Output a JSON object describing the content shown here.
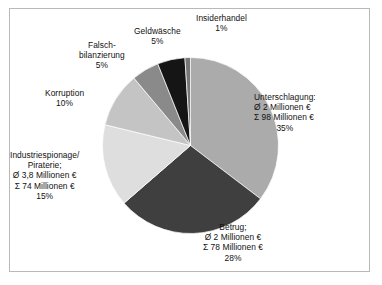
{
  "figure": {
    "border_color": "#b9b9b9",
    "background": "#ffffff"
  },
  "chart_data": {
    "type": "pie",
    "title": "",
    "subtitle": "",
    "xlabel": "",
    "ylabel": "",
    "legend_position": "none",
    "grid": false,
    "start_angle_deg": 0,
    "direction": "clockwise",
    "currency": "€",
    "unit_label": "Millionen €",
    "mean_symbol": "Ø",
    "sum_symbol": "Σ",
    "categories": [
      "Unterschlagung",
      "Betrug",
      "Industriespionage/Piraterie",
      "Korruption",
      "Falschbilanzierung",
      "Geldwäsche",
      "Insiderhandel"
    ],
    "values": [
      35,
      28,
      15,
      10,
      5,
      5,
      1
    ],
    "colors": [
      "#ababab",
      "#3f3f3f",
      "#dedede",
      "#c4c4c4",
      "#8a8a8a",
      "#151515",
      "#777777"
    ],
    "slices": [
      {
        "name": "Unterschlagung",
        "percent": 35,
        "percent_label": "35%",
        "mean": "Ø 2 Millionen €",
        "sum": "Σ 98 Millionen €",
        "color": "#ababab"
      },
      {
        "name": "Betrug",
        "percent": 28,
        "percent_label": "28%",
        "mean": "Ø 2 Millionen €",
        "sum": "Σ 78 Millionen €",
        "color": "#3f3f3f"
      },
      {
        "name": "Industriespionage/Piraterie",
        "percent": 15,
        "percent_label": "15%",
        "mean": "Ø 3,8 Millionen €",
        "sum": "Σ 74 Millionen €",
        "color": "#dedede"
      },
      {
        "name": "Korruption",
        "percent": 10,
        "percent_label": "10%",
        "mean": "",
        "sum": "",
        "color": "#c4c4c4"
      },
      {
        "name": "Falschbilanzierung",
        "percent": 5,
        "percent_label": "5%",
        "mean": "",
        "sum": "",
        "color": "#8a8a8a"
      },
      {
        "name": "Geldwäsche",
        "percent": 5,
        "percent_label": "5%",
        "mean": "",
        "sum": "",
        "color": "#151515"
      },
      {
        "name": "Insiderhandel",
        "percent": 1,
        "percent_label": "1%",
        "mean": "",
        "sum": "",
        "color": "#777777"
      }
    ]
  },
  "labels": {
    "insiderhandel": {
      "line1": "Insiderhandel",
      "line2": "1%"
    },
    "geldwaesche": {
      "line1": "Geldwäsche",
      "line2": "5%"
    },
    "falschbilanzierung": {
      "line1": "Falsch-",
      "line2": "bilanzierung",
      "line3": "5%"
    },
    "korruption": {
      "line1": "Korruption",
      "line2": "10%"
    },
    "industriespionage": {
      "line1": "Industriespionage/",
      "line2": "Piraterie;",
      "line3": "Ø 3,8 Millionen €",
      "line4": "Σ 74 Millionen €",
      "line5": "15%"
    },
    "unterschlagung": {
      "line1": "Unterschlagung:",
      "line2": "Ø 2 Millionen €",
      "line3": "Σ 98 Millionen €",
      "line4": "35%"
    },
    "betrug": {
      "line1": "Betrug;",
      "line2": "Ø 2 Millionen €",
      "line3": "Σ 78 Millionen €",
      "line4": "28%"
    }
  }
}
